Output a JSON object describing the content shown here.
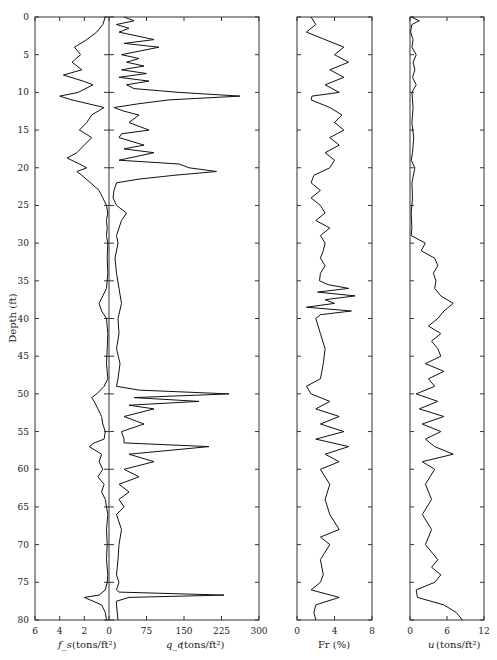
{
  "chart_data": [
    {
      "type": "line",
      "panel": "fs-qc",
      "title": "",
      "ylabel": "Depth (ft)",
      "ylim": [
        0,
        80
      ],
      "y_ticks": [
        0,
        5,
        10,
        15,
        20,
        25,
        30,
        35,
        40,
        45,
        50,
        55,
        60,
        65,
        70,
        75,
        80
      ],
      "series": [
        {
          "name": "f_s",
          "xlabel": "f_s (tons/ft²)",
          "x_direction": "reversed",
          "xlim": [
            6,
            0
          ],
          "x_ticks": [
            6,
            4,
            2,
            0
          ],
          "depth": [
            0,
            1,
            2,
            3,
            4,
            5,
            6,
            7,
            7.7,
            8.5,
            9,
            10,
            10.5,
            11,
            12,
            13,
            14,
            15,
            16,
            17,
            18,
            18.7,
            19.5,
            20,
            20.5,
            21,
            22,
            23,
            24,
            25,
            26,
            27,
            28,
            29,
            30,
            32,
            34,
            36,
            37,
            38,
            39,
            40,
            42,
            44,
            46,
            48,
            49,
            50,
            50.5,
            51,
            52,
            53,
            54,
            55,
            56,
            56.5,
            57,
            58,
            59,
            60,
            61,
            62,
            63,
            64,
            65,
            66,
            68,
            70,
            72,
            74,
            75,
            76,
            76.7,
            77,
            78,
            79,
            80
          ],
          "values": [
            0.3,
            0.5,
            1.0,
            1.8,
            2.8,
            2.3,
            3.0,
            2.2,
            3.7,
            2.1,
            1.3,
            2.5,
            4.0,
            3.0,
            0.4,
            1.4,
            1.8,
            2.4,
            1.4,
            2.0,
            2.6,
            3.4,
            2.4,
            1.8,
            2.6,
            2.2,
            1.5,
            0.8,
            0.5,
            0.2,
            0.1,
            0.2,
            0.15,
            0.2,
            0.1,
            0.15,
            0.1,
            0.2,
            0.5,
            0.8,
            0.6,
            0.2,
            0.1,
            0.15,
            0.2,
            0.1,
            0.4,
            1.0,
            1.4,
            1.2,
            0.9,
            0.6,
            0.5,
            0.3,
            0.4,
            1.2,
            1.6,
            0.6,
            0.8,
            0.5,
            0.9,
            0.4,
            0.6,
            0.3,
            0.2,
            0.1,
            0.2,
            0.15,
            0.2,
            0.1,
            0.15,
            0.3,
            0.8,
            2.0,
            0.6,
            0.3,
            0.2,
            0.25
          ]
        },
        {
          "name": "q_c",
          "xlabel": "q_c (tons/ft²)",
          "xlim": [
            0,
            300
          ],
          "x_ticks": [
            0,
            75,
            150,
            225,
            300
          ],
          "depth": [
            0,
            0.5,
            1,
            1.5,
            2,
            3,
            3.5,
            4,
            5,
            5.5,
            6,
            6.5,
            7,
            7.5,
            8,
            8.5,
            9,
            9.5,
            10,
            10.5,
            11,
            11.5,
            12,
            12.5,
            13,
            14,
            15,
            15.5,
            16,
            17,
            17.5,
            18,
            19,
            19.5,
            20,
            20.5,
            21,
            21.5,
            22,
            23,
            24,
            25,
            26,
            27,
            28,
            29,
            30,
            32,
            34,
            36,
            38,
            40,
            42,
            44,
            46,
            48,
            49,
            49.5,
            50,
            50.5,
            51,
            51.5,
            52,
            53,
            54,
            55,
            56,
            56.5,
            57,
            58,
            59,
            60,
            61,
            62,
            63,
            64,
            65,
            66,
            68,
            70,
            72,
            74,
            75,
            76,
            76.3,
            76.7,
            77,
            77.5,
            78,
            80
          ],
          "values": [
            30,
            50,
            15,
            40,
            20,
            90,
            30,
            100,
            25,
            60,
            35,
            70,
            25,
            75,
            20,
            80,
            35,
            50,
            140,
            262,
            120,
            60,
            10,
            30,
            60,
            40,
            80,
            25,
            20,
            70,
            30,
            90,
            20,
            140,
            160,
            215,
            130,
            60,
            15,
            10,
            8,
            15,
            35,
            25,
            20,
            15,
            18,
            12,
            15,
            20,
            25,
            18,
            20,
            15,
            22,
            18,
            15,
            60,
            240,
            50,
            180,
            40,
            90,
            30,
            70,
            25,
            30,
            30,
            200,
            40,
            90,
            30,
            60,
            20,
            40,
            20,
            30,
            15,
            25,
            20,
            18,
            15,
            20,
            15,
            20,
            230,
            40,
            15,
            15,
            18
          ]
        }
      ]
    },
    {
      "type": "line",
      "panel": "friction-ratio",
      "xlabel": "Fr (%)",
      "xlim": [
        0,
        8
      ],
      "x_ticks": [
        0,
        4,
        8
      ],
      "ylim": [
        0,
        80
      ],
      "series": [
        {
          "name": "Fr",
          "depth": [
            0,
            1,
            2,
            3,
            4,
            5,
            6,
            7,
            8,
            9,
            10,
            10.5,
            11,
            12,
            13,
            14,
            15,
            16,
            17,
            18,
            19,
            20,
            21,
            22,
            23,
            24,
            25,
            26,
            27,
            28,
            29,
            30,
            31,
            32,
            33,
            34,
            35,
            35.5,
            36,
            36.5,
            37,
            37.5,
            38,
            38.5,
            39,
            39.5,
            40,
            42,
            44,
            46,
            48,
            49,
            50,
            51,
            52,
            53,
            54,
            55,
            56,
            57,
            58,
            59,
            60,
            62,
            64,
            66,
            68,
            69,
            70,
            72,
            74,
            75,
            76,
            77,
            78,
            79,
            80
          ],
          "values": [
            1.5,
            2.0,
            1.0,
            3.0,
            5.0,
            4.0,
            5.5,
            3.5,
            5.0,
            3.0,
            4.5,
            1.6,
            1.5,
            3.5,
            4.8,
            4.0,
            5.0,
            3.5,
            4.5,
            3.0,
            4.0,
            3.5,
            1.8,
            1.5,
            2.5,
            1.5,
            2.5,
            3.0,
            2.0,
            3.5,
            2.5,
            3.0,
            2.8,
            2.5,
            3.0,
            2.5,
            2.4,
            3.3,
            5.5,
            2.2,
            6.2,
            3.0,
            4.0,
            1.0,
            5.8,
            2.5,
            2.0,
            2.5,
            3.0,
            2.8,
            2.5,
            1.0,
            1.5,
            3.5,
            2.0,
            4.5,
            2.5,
            5.0,
            2.0,
            5.5,
            3.0,
            4.5,
            2.5,
            3.5,
            3.0,
            3.5,
            4.5,
            2.5,
            3.5,
            2.5,
            2.8,
            2.5,
            1.5,
            4.5,
            2.0,
            1.8,
            2.0
          ]
        }
      ]
    },
    {
      "type": "line",
      "panel": "pore-pressure",
      "xlabel": "u (tons/ft²)",
      "xlim": [
        0,
        12
      ],
      "x_ticks": [
        0,
        6,
        12
      ],
      "ylim": [
        0,
        80
      ],
      "series": [
        {
          "name": "u",
          "depth": [
            0,
            0.5,
            1,
            1.5,
            2,
            3,
            4,
            5,
            6,
            7,
            8,
            9,
            10,
            12,
            14,
            16,
            18,
            19,
            20,
            22,
            24,
            26,
            28,
            29,
            30,
            31,
            32,
            33,
            34,
            35,
            36,
            37,
            38,
            39,
            40,
            41,
            42,
            43,
            44,
            45,
            46,
            47,
            48,
            49,
            50,
            51,
            52,
            53,
            54,
            55,
            56,
            57,
            58,
            59,
            60,
            62,
            64,
            66,
            68,
            70,
            72,
            73,
            74,
            75,
            76,
            77,
            78,
            79,
            80
          ],
          "values": [
            0.2,
            1.5,
            0.3,
            0.2,
            0.1,
            0.5,
            0.3,
            1.0,
            0.5,
            0.8,
            0.4,
            1.0,
            0.3,
            0.5,
            0.3,
            0.6,
            0.4,
            0.2,
            0.8,
            0.3,
            0.4,
            0.2,
            0.3,
            0.2,
            2.5,
            1.8,
            4.0,
            4.5,
            3.8,
            4.2,
            4.0,
            5.0,
            7.0,
            5.5,
            4.5,
            3.0,
            5.0,
            3.5,
            4.5,
            5.0,
            2.5,
            5.5,
            3.0,
            4.0,
            1.0,
            4.5,
            1.5,
            5.5,
            2.0,
            5.0,
            2.5,
            4.0,
            7.0,
            2.0,
            4.0,
            2.5,
            3.5,
            2.0,
            3.5,
            2.5,
            4.5,
            3.5,
            5.0,
            4.0,
            1.0,
            1.2,
            5.5,
            7.5,
            8.5
          ]
        }
      ]
    }
  ],
  "labels": {
    "depth_axis": "Depth (ft)",
    "fs_axis": "f_s",
    "fs_units": "(tons/ft²)",
    "qc_axis": "q_c",
    "qc_units": "(tons/ft²)",
    "fr_axis": "Fr (%)",
    "u_axis": "u",
    "u_units": "(tons/ft²)"
  }
}
